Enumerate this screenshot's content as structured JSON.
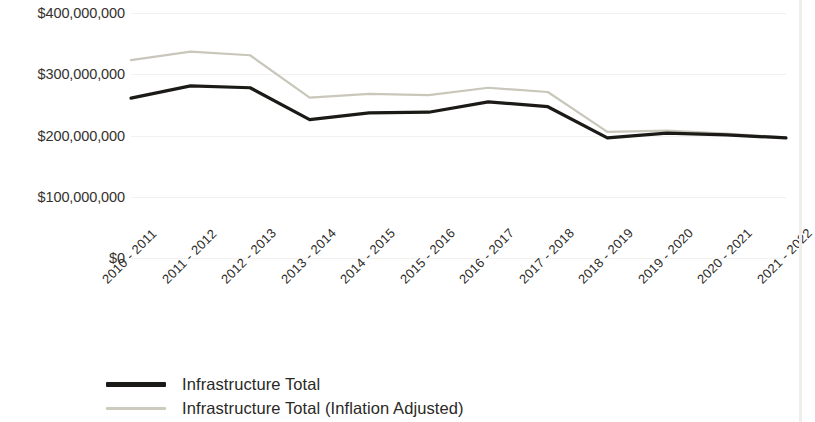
{
  "chart_data": {
    "type": "line",
    "title": "",
    "subtitle": "",
    "xlabel": "",
    "ylabel": "",
    "categories": [
      "2010 - 2011",
      "2011 - 2012",
      "2012 - 2013",
      "2013 - 2014",
      "2014 - 2015",
      "2015 - 2016",
      "2016 - 2017",
      "2017 - 2018",
      "2018 - 2019",
      "2019 - 2020",
      "2020 - 2021",
      "2021 - 2022"
    ],
    "series": [
      {
        "name": "Infrastructure Total",
        "color": "#1c1a17",
        "values": [
          261000000,
          281000000,
          278000000,
          226000000,
          237000000,
          238000000,
          255000000,
          247000000,
          196000000,
          204000000,
          201000000,
          196000000
        ]
      },
      {
        "name": "Infrastructure Total (Inflation Adjusted)",
        "color": "#c9c7ba",
        "values": [
          323000000,
          337000000,
          331000000,
          262000000,
          268000000,
          266000000,
          278000000,
          271000000,
          206000000,
          208000000,
          203000000,
          197000000
        ]
      }
    ],
    "ytick_labels": [
      "$400,000,000",
      "$300,000,000",
      "$200,000,000",
      "$100,000,000",
      "$0"
    ],
    "ytick_values": [
      400000000,
      300000000,
      200000000,
      100000000,
      0
    ],
    "ylim": [
      0,
      400000000
    ],
    "grid": "horizontal",
    "grid_color": "#f2f1ee",
    "legend_position": "bottom-left"
  },
  "legend": {
    "items": [
      {
        "label": "Infrastructure Total",
        "color": "#1c1a17",
        "weight": "thick"
      },
      {
        "label": "Infrastructure Total (Inflation Adjusted)",
        "color": "#cdcbbe",
        "weight": "thin"
      }
    ]
  }
}
